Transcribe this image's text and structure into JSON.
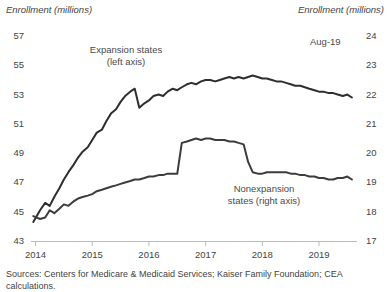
{
  "chart_data": {
    "type": "line",
    "title": "",
    "ylabel": "Enrollment (millions)",
    "ylabel_right": "Enrollment (millions)",
    "xlabel": "",
    "ylim": [
      43,
      57
    ],
    "ylim_right": [
      17,
      24
    ],
    "xlim": [
      2013.92,
      2019.67
    ],
    "grid": false,
    "legend_position": "inline-annotations",
    "yticks": [
      43,
      45,
      47,
      49,
      51,
      53,
      55,
      57
    ],
    "yticks_right": [
      17,
      18,
      19,
      20,
      21,
      22,
      23,
      24
    ],
    "xticks": [
      2014,
      2015,
      2016,
      2017,
      2018,
      2019
    ],
    "xtick_labels": [
      "2014",
      "2015",
      "2016",
      "2017",
      "2018",
      "2019"
    ],
    "annotations": [
      {
        "text": "Expansion states\n(left axis)",
        "x": 2014.9,
        "y": 55.4
      },
      {
        "text": "Nonexpansion\nstates (right axis)",
        "x": 2017.6,
        "y": 45.6
      },
      {
        "text": "Aug-19",
        "x": 2019.2,
        "y": 55.9
      }
    ],
    "series": [
      {
        "name": "Expansion states (left axis)",
        "axis": "left",
        "color": "#2e2e2e",
        "x": [
          2013.96,
          2014.08,
          2014.17,
          2014.25,
          2014.33,
          2014.42,
          2014.5,
          2014.58,
          2014.67,
          2014.75,
          2014.83,
          2014.92,
          2015.0,
          2015.08,
          2015.17,
          2015.25,
          2015.33,
          2015.42,
          2015.5,
          2015.58,
          2015.67,
          2015.75,
          2015.83,
          2015.92,
          2016.0,
          2016.08,
          2016.17,
          2016.25,
          2016.33,
          2016.42,
          2016.5,
          2016.58,
          2016.67,
          2016.75,
          2016.83,
          2016.92,
          2017.0,
          2017.08,
          2017.17,
          2017.25,
          2017.33,
          2017.42,
          2017.5,
          2017.58,
          2017.67,
          2017.75,
          2017.83,
          2017.92,
          2018.0,
          2018.08,
          2018.17,
          2018.25,
          2018.33,
          2018.42,
          2018.5,
          2018.58,
          2018.67,
          2018.75,
          2018.83,
          2018.92,
          2019.0,
          2019.08,
          2019.17,
          2019.25,
          2019.33,
          2019.42,
          2019.5,
          2019.58
        ],
        "values": [
          44.3,
          45.1,
          45.6,
          45.4,
          46.0,
          46.6,
          47.2,
          47.7,
          48.2,
          48.7,
          49.1,
          49.4,
          49.9,
          50.4,
          50.6,
          51.2,
          51.7,
          52.0,
          52.5,
          52.9,
          53.2,
          53.4,
          52.1,
          52.4,
          52.6,
          52.9,
          53.0,
          52.9,
          53.2,
          53.4,
          53.3,
          53.5,
          53.7,
          53.8,
          53.7,
          53.9,
          54.0,
          54.0,
          53.9,
          54.0,
          54.1,
          54.2,
          54.1,
          54.2,
          54.1,
          54.2,
          54.3,
          54.2,
          54.1,
          54.1,
          54.0,
          53.9,
          53.9,
          53.8,
          53.7,
          53.6,
          53.6,
          53.5,
          53.4,
          53.3,
          53.2,
          53.2,
          53.1,
          53.1,
          53.0,
          52.9,
          53.0,
          52.8
        ]
      },
      {
        "name": "Nonexpansion states (right axis)",
        "axis": "right",
        "color": "#3c3c3c",
        "x": [
          2013.96,
          2014.08,
          2014.17,
          2014.25,
          2014.33,
          2014.42,
          2014.5,
          2014.58,
          2014.67,
          2014.75,
          2014.83,
          2014.92,
          2015.0,
          2015.08,
          2015.17,
          2015.25,
          2015.33,
          2015.42,
          2015.5,
          2015.58,
          2015.67,
          2015.75,
          2015.83,
          2015.92,
          2016.0,
          2016.08,
          2016.17,
          2016.25,
          2016.33,
          2016.42,
          2016.5,
          2016.58,
          2016.67,
          2016.75,
          2016.83,
          2016.92,
          2017.0,
          2017.08,
          2017.17,
          2017.25,
          2017.33,
          2017.42,
          2017.5,
          2017.58,
          2017.67,
          2017.75,
          2017.83,
          2017.92,
          2018.0,
          2018.08,
          2018.17,
          2018.25,
          2018.33,
          2018.42,
          2018.5,
          2018.58,
          2018.67,
          2018.75,
          2018.83,
          2018.92,
          2019.0,
          2019.08,
          2019.17,
          2019.25,
          2019.33,
          2019.42,
          2019.5,
          2019.58
        ],
        "values": [
          17.85,
          17.75,
          17.8,
          18.05,
          17.95,
          18.1,
          18.25,
          18.2,
          18.35,
          18.45,
          18.5,
          18.55,
          18.6,
          18.7,
          18.75,
          18.8,
          18.85,
          18.9,
          18.95,
          19.0,
          19.05,
          19.1,
          19.1,
          19.15,
          19.2,
          19.2,
          19.25,
          19.25,
          19.3,
          19.3,
          19.3,
          20.35,
          20.4,
          20.45,
          20.5,
          20.45,
          20.5,
          20.5,
          20.45,
          20.45,
          20.45,
          20.4,
          20.4,
          20.35,
          20.3,
          19.7,
          19.35,
          19.3,
          19.3,
          19.35,
          19.35,
          19.35,
          19.35,
          19.35,
          19.3,
          19.3,
          19.25,
          19.25,
          19.2,
          19.2,
          19.15,
          19.15,
          19.1,
          19.1,
          19.15,
          19.15,
          19.2,
          19.1
        ]
      }
    ]
  },
  "labels": {
    "axis_title_left": "Enrollment (millions)",
    "axis_title_right": "Enrollment (millions)",
    "expansion_label": "Expansion states",
    "expansion_sublabel": "(left axis)",
    "nonexpansion_label": "Nonexpansion",
    "nonexpansion_sublabel": "states (right axis)",
    "annotation_aug19": "Aug-19",
    "source_note": "Sources: Centers for Medicare & Medicaid Services; Kaiser Family Foundation; CEA calculations."
  },
  "colors": {
    "line": "#2e2e2e",
    "axis": "#b8b8b8",
    "text": "#3f3f3f"
  }
}
